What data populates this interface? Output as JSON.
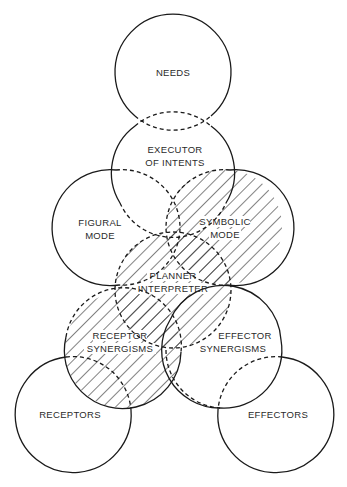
{
  "diagram": {
    "stroke_color": "#1a1a1a",
    "background": "#ffffff",
    "nodes": [
      {
        "id": "needs",
        "lines": [
          "NEEDS"
        ],
        "cx": 173,
        "cy": 72,
        "r": 58,
        "hatched": false
      },
      {
        "id": "executor",
        "lines": [
          "EXECUTOR",
          "OF INTENTS"
        ],
        "cx": 173,
        "cy": 170,
        "r": 58,
        "hatched": false
      },
      {
        "id": "figural",
        "lines": [
          "FIGURAL",
          "MODE"
        ],
        "cx": 122,
        "cy": 227,
        "r": 58,
        "hatched": false
      },
      {
        "id": "symbolic",
        "lines": [
          "SYMBOLIC",
          "MODE"
        ],
        "cx": 224,
        "cy": 227,
        "r": 58,
        "hatched": true
      },
      {
        "id": "planner",
        "lines": [
          "PLANNER",
          "INTERPRETER"
        ],
        "cx": 173,
        "cy": 290,
        "r": 58,
        "hatched": true
      },
      {
        "id": "receptor_syn",
        "lines": [
          "RECEPTOR",
          "SYNERGISMS"
        ],
        "cx": 123,
        "cy": 350,
        "r": 58,
        "hatched": true
      },
      {
        "id": "effector_syn",
        "lines": [
          "EFFECTOR",
          "SYNERGISMS"
        ],
        "cx": 224,
        "cy": 350,
        "r": 58,
        "hatched": false
      },
      {
        "id": "receptors",
        "lines": [
          "RECEPTORS"
        ],
        "cx": 73,
        "cy": 415,
        "r": 58,
        "hatched": false
      },
      {
        "id": "effectors",
        "lines": [
          "EFFECTORS"
        ],
        "cx": 276,
        "cy": 415,
        "r": 58,
        "hatched": false
      }
    ],
    "labels": {
      "needs": "NEEDS",
      "executor_1": "EXECUTOR",
      "executor_2": "OF INTENTS",
      "figural_1": "FIGURAL",
      "figural_2": "MODE",
      "symbolic_1": "SYMBOLIC",
      "symbolic_2": "MODE",
      "planner_1": "PLANNER",
      "planner_2": "INTERPRETER",
      "receptor_syn_1": "RECEPTOR",
      "receptor_syn_2": "SYNERGISMS",
      "effector_syn_1": "EFFECTOR",
      "effector_syn_2": "SYNERGISMS",
      "receptors": "RECEPTORS",
      "effectors": "EFFECTORS"
    }
  }
}
